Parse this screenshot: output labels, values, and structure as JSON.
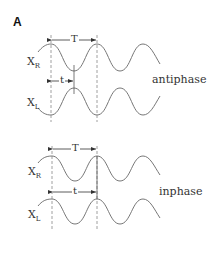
{
  "panel": {
    "label": "A"
  },
  "antiphase": {
    "title": "antiphase",
    "signal_top": {
      "name": "X",
      "sub": "R"
    },
    "signal_bottom": {
      "name": "X",
      "sub": "L"
    },
    "period_label": "T",
    "delay_label": "t"
  },
  "inphase": {
    "title": "inphase",
    "signal_top": {
      "name": "X",
      "sub": "R"
    },
    "signal_bottom": {
      "name": "X",
      "sub": "L"
    },
    "period_label": "T",
    "delay_label": "t"
  },
  "colors": {
    "wave": "#777777",
    "dash": "#888888",
    "text": "#333333"
  }
}
